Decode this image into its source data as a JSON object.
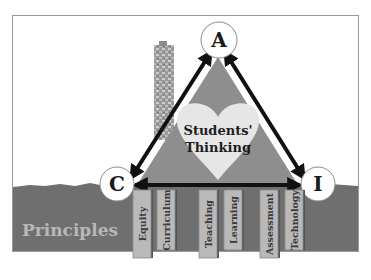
{
  "diagram": {
    "center_label": [
      "Students'",
      "Thinking"
    ],
    "vertices": [
      {
        "id": "top",
        "label": "A"
      },
      {
        "id": "left",
        "label": "C"
      },
      {
        "id": "right",
        "label": "I"
      }
    ],
    "ground_label": "Principles",
    "pillars": [
      {
        "label": "Equity"
      },
      {
        "label": "Curriculum"
      },
      {
        "label": "Teaching"
      },
      {
        "label": "Learning"
      },
      {
        "label": "Assessment"
      },
      {
        "label": "Technology"
      }
    ],
    "colors": {
      "ground": "#6f6f6f",
      "triangle": "#8e8e8e",
      "heart": "#e6e6e6",
      "pillar": "#b9b9b9",
      "arrow": "#111111",
      "principles_text": "#b8b8b8"
    }
  }
}
